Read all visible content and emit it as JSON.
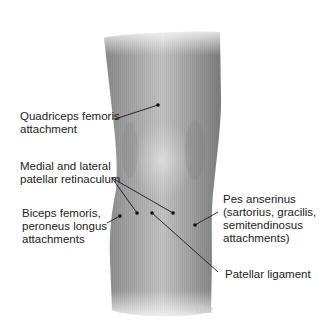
{
  "figure": {
    "colors": {
      "skin_dark": "#7a7a7a",
      "skin_light": "#d8d8d8",
      "leader": "#1a1a1a",
      "text": "#222222"
    },
    "labels": [
      {
        "id": "quadriceps",
        "text": "Quadriceps femoris\nattachment",
        "x": 20,
        "y": 110,
        "dots": [
          [
            158,
            105
          ]
        ],
        "line_from": [
          115,
          119
        ]
      },
      {
        "id": "retinaculum",
        "text": "Medial and lateral\npatellar retinaculum",
        "x": 20,
        "y": 160,
        "dots": [
          [
            137,
            213
          ],
          [
            173,
            213
          ]
        ],
        "line_from": [
          112,
          178
        ]
      },
      {
        "id": "biceps",
        "text": "Biceps femoris,\nperoneus longus\nattachments",
        "x": 22,
        "y": 207,
        "dots": [
          [
            120,
            216
          ]
        ],
        "line_from": [
          107,
          223
        ]
      },
      {
        "id": "pes",
        "text": "Pes anserinus\n(sartorius, gracilis,\nsemitendinosus\nattachments)",
        "x": 223,
        "y": 193,
        "dots": [
          [
            195,
            225
          ]
        ],
        "line_from": [
          218,
          212
        ]
      },
      {
        "id": "patellar-ligament",
        "text": "Patellar ligament",
        "x": 225,
        "y": 268,
        "dots": [
          [
            152,
            213
          ]
        ],
        "line_from": [
          218,
          272
        ]
      }
    ],
    "signature": "DAR"
  }
}
